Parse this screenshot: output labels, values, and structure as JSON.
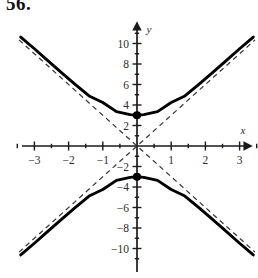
{
  "problem": {
    "number": "56."
  },
  "figure": {
    "name": "hyperbola-graph",
    "axis_labels": {
      "x": "x",
      "y": "y"
    },
    "x_tick_labels": [
      "-3",
      "-2",
      "-1",
      "1",
      "2",
      "3"
    ],
    "y_tick_labels": [
      "10",
      "8",
      "6",
      "4",
      "2",
      "-2",
      "-4",
      "-6",
      "-8",
      "-10"
    ],
    "colors": {
      "curve": "#000000",
      "axis": "#1a1a1a",
      "asymptote": "#3a3a3a",
      "vertex": "#000000"
    }
  },
  "chart_data": {
    "type": "line",
    "title": "",
    "xlabel": "x",
    "ylabel": "y",
    "grid": false,
    "legend": null,
    "xlim": [
      -3.5,
      3.5
    ],
    "ylim": [
      -11.5,
      11.0
    ],
    "x_ticks_major": [
      -3,
      -2,
      -1,
      1,
      2,
      3
    ],
    "x_ticks_minor": [
      -3.5,
      -2.5,
      -1.5,
      -0.5,
      0.5,
      1.5,
      2.5,
      3.5
    ],
    "y_ticks_major": [
      10,
      8,
      6,
      4,
      2,
      -2,
      -4,
      -6,
      -8,
      -10
    ],
    "y_ticks_minor": [
      11,
      9,
      7,
      5,
      3,
      1,
      -1,
      -3,
      -5,
      -7,
      -9,
      -11
    ],
    "curve_equation": "y^2/9 - x^2/1 = 1",
    "a": 3,
    "b": 1,
    "vertices": [
      [
        0,
        3
      ],
      [
        0,
        -3
      ]
    ],
    "asymptote_slopes": [
      3,
      -3
    ],
    "series": [
      {
        "name": "upper-branch",
        "style": "solid",
        "x": [
          -3.4,
          -3.0,
          -2.6,
          -2.2,
          -1.8,
          -1.4,
          -1.0,
          -0.6,
          -0.2,
          0.0,
          0.2,
          0.6,
          1.0,
          1.4,
          1.8,
          2.2,
          2.6,
          3.0,
          3.4
        ],
        "y": [
          10.63,
          9.49,
          8.31,
          7.14,
          5.99,
          4.88,
          4.24,
          3.35,
          3.06,
          3.0,
          3.06,
          3.35,
          4.24,
          4.88,
          5.99,
          7.14,
          8.31,
          9.49,
          10.63
        ]
      },
      {
        "name": "lower-branch",
        "style": "solid",
        "x": [
          -3.4,
          -3.0,
          -2.6,
          -2.2,
          -1.8,
          -1.4,
          -1.0,
          -0.6,
          -0.2,
          0.0,
          0.2,
          0.6,
          1.0,
          1.4,
          1.8,
          2.2,
          2.6,
          3.0,
          3.4
        ],
        "y": [
          -10.63,
          -9.49,
          -8.31,
          -7.14,
          -5.99,
          -4.88,
          -4.24,
          -3.35,
          -3.06,
          -3.0,
          -3.06,
          -3.35,
          -4.24,
          -4.88,
          -5.99,
          -7.14,
          -8.31,
          -9.49,
          -10.63
        ]
      },
      {
        "name": "asymptote-positive-slope",
        "style": "dashed",
        "x": [
          -3.45,
          3.45
        ],
        "y": [
          -10.35,
          10.35
        ]
      },
      {
        "name": "asymptote-negative-slope",
        "style": "dashed",
        "x": [
          -3.45,
          3.45
        ],
        "y": [
          10.35,
          -10.35
        ]
      }
    ],
    "points": [
      {
        "name": "vertex-upper",
        "x": 0,
        "y": 3,
        "marker": "filled-circle"
      },
      {
        "name": "vertex-lower",
        "x": 0,
        "y": -3,
        "marker": "filled-circle"
      }
    ]
  }
}
